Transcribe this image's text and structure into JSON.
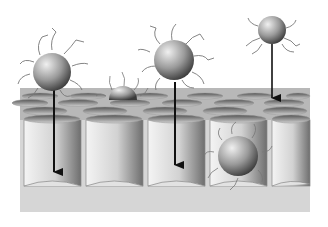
{
  "figure": {
    "background": "#ffffff",
    "membrane": {
      "top_color": "#b4b4b4",
      "pore_inner_light": "#f2f2f2",
      "pore_inner_dark": "#7a7a7a",
      "base_color": "#d6d6d6",
      "pore_count_visible_front": 5
    },
    "particles": [
      {
        "id": "p1",
        "cx": 52,
        "cy": 72,
        "r": 20,
        "state": "above-surface",
        "arrow": true
      },
      {
        "id": "p2",
        "cx": 123,
        "cy": 98,
        "r": 13,
        "state": "partially-embedded",
        "arrow": false
      },
      {
        "id": "p3",
        "cx": 174,
        "cy": 60,
        "r": 21,
        "state": "above-surface",
        "arrow": true
      },
      {
        "id": "p4",
        "cx": 272,
        "cy": 30,
        "r": 15,
        "state": "above-surface",
        "arrow": true
      },
      {
        "id": "p5",
        "cx": 238,
        "cy": 156,
        "r": 22,
        "state": "inside-pore",
        "arrow": false
      }
    ],
    "arrows": [
      {
        "from_particle": "p1",
        "x": 54,
        "y1": 90,
        "y2": 172
      },
      {
        "from_particle": "p3",
        "x": 175,
        "y1": 82,
        "y2": 165
      },
      {
        "from_particle": "p4",
        "x": 272,
        "y1": 44,
        "y2": 98
      }
    ],
    "colors": {
      "arrow": "#111111",
      "particle_light": "#e8e8e8",
      "particle_dark": "#4a4a4a",
      "ligand": "#6a6a6a"
    }
  }
}
